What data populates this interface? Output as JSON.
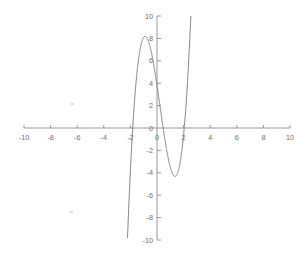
{
  "chart_data": {
    "type": "line",
    "title": "",
    "subtitle": "",
    "xlabel": "",
    "ylabel": "",
    "xlim": [
      -10,
      10
    ],
    "ylim": [
      -10,
      10
    ],
    "grid": false,
    "legend": null,
    "legend_position": "none",
    "x_ticks": [
      -10,
      -8,
      -6,
      -4,
      -2,
      0,
      2,
      4,
      6,
      8,
      10
    ],
    "x_tick_labels": [
      "-10",
      "-8",
      "-6",
      "-4",
      "-2",
      "0",
      "2",
      "4",
      "6",
      "8",
      "10"
    ],
    "y_ticks": [
      10,
      8,
      6,
      4,
      2,
      0,
      -2,
      -4,
      -6,
      -8,
      -10
    ],
    "y_tick_labels": [
      "10",
      "8",
      "6",
      "4",
      "2",
      "0",
      "-2",
      "-4",
      "-6",
      "-8",
      "-10"
    ],
    "curve_color": "#7a7a7a",
    "axis_color": "#8c8c8c",
    "tick_label_color": "#6d6d6d",
    "background_color": "#ffffff",
    "series": [
      {
        "name": "cubic",
        "equation": "y = 2.2x^3 - 1.5x^2 - 8x + 3.8",
        "x": [
          -2.92,
          -2.8,
          -2.6,
          -2.4,
          -2.2,
          -2.0,
          -1.8,
          -1.6,
          -1.4,
          -1.2,
          -1.1,
          -1.0,
          -0.8,
          -0.6,
          -0.4,
          -0.2,
          0.0,
          0.2,
          0.4,
          0.6,
          0.8,
          1.0,
          1.2,
          1.4,
          1.6,
          1.8,
          2.0,
          2.2,
          2.4,
          2.6,
          2.8,
          2.92
        ],
        "y": [
          -10.0,
          -8.6,
          -5.9,
          -3.4,
          -1.1,
          0.9,
          2.6,
          4.1,
          5.3,
          6.2,
          6.5,
          6.7,
          7.0,
          7.0,
          6.8,
          6.3,
          3.8,
          2.1,
          0.5,
          -0.9,
          -1.9,
          -2.5,
          -2.7,
          -2.6,
          -1.6,
          0.2,
          3.0,
          6.8,
          11.8,
          18.0,
          25.6,
          30.6
        ]
      }
    ],
    "features": {
      "local_maximum": {
        "x": -1.1,
        "y": 9.7
      },
      "local_minimum": {
        "x": 1.4,
        "y": -1.6
      },
      "y_intercept": {
        "x": 0.0,
        "y": 3.8
      },
      "left_root": {
        "x": -2.85,
        "y": 0
      },
      "middle_root": {
        "x": 0.45,
        "y": 0
      },
      "right_root": {
        "x": 1.85,
        "y": 0
      }
    }
  }
}
